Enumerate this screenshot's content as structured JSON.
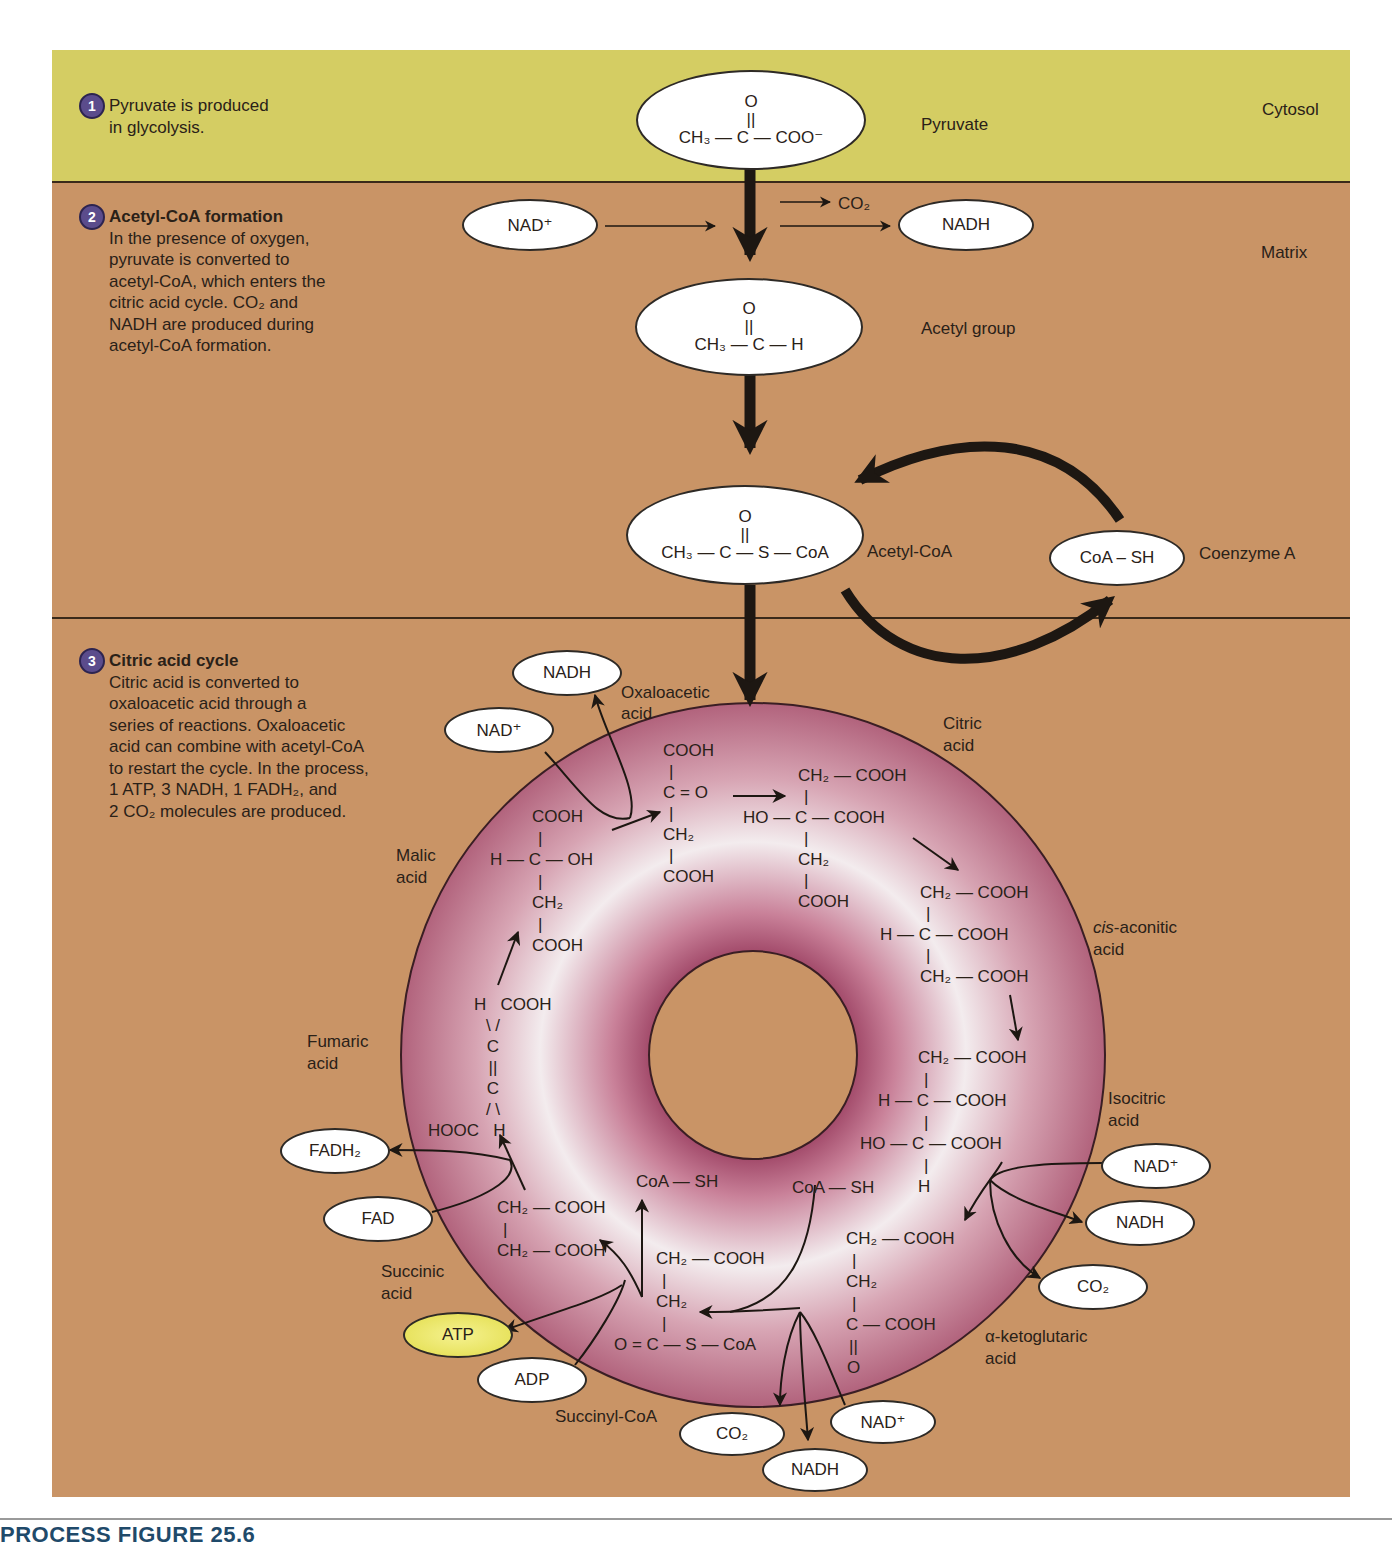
{
  "regions": {
    "cytosol": "Cytosol",
    "matrix": "Matrix"
  },
  "colors": {
    "cytosol_bg": "#d4cd63",
    "matrix_bg": "#c99466",
    "cycle_ring": "#b8687e",
    "step_badge": "#5b4c8c",
    "atp_fill": "#e2dc4a"
  },
  "steps": [
    {
      "number": "1",
      "title": "",
      "text": "Pyruvate is produced in glycolysis."
    },
    {
      "number": "2",
      "title": "Acetyl-CoA formation",
      "text": "In the presence of oxygen, pyruvate is converted to acetyl-CoA, which enters the citric acid cycle. CO2 and NADH are produced during acetyl-CoA formation."
    },
    {
      "number": "3",
      "title": "Citric acid cycle",
      "text": "Citric acid is converted to oxaloacetic acid through a series of reactions. Oxaloacetic acid can combine with acetyl-CoA to restart the cycle. In the process, 1 ATP, 3 NADH, 1 FADH2, and 2 CO2 molecules are produced."
    }
  ],
  "step_lines": {
    "s1": [
      "Pyruvate is produced",
      "in glycolysis."
    ],
    "s2": [
      "In the presence of oxygen,",
      "pyruvate is converted to",
      "acetyl-CoA, which enters the",
      "citric acid cycle. CO₂ and",
      "NADH are produced during",
      "acetyl-CoA formation."
    ],
    "s3": [
      "Citric acid is converted to",
      "oxaloacetic acid through a",
      "series of reactions. Oxaloacetic",
      "acid can combine with acetyl-CoA",
      "to restart the cycle. In the process,",
      "1 ATP, 3 NADH, 1 FADH₂, and",
      "2 CO₂ molecules are produced."
    ]
  },
  "molecule_labels": {
    "pyruvate": "Pyruvate",
    "acetyl_group": "Acetyl group",
    "acetyl_coa": "Acetyl-CoA",
    "coenzyme_a": "Coenzyme A",
    "oxaloacetic": [
      "Oxaloacetic",
      "acid"
    ],
    "citric": [
      "Citric",
      "acid"
    ],
    "cis_aconitic": [
      "cis",
      "-aconitic",
      "acid"
    ],
    "isocitric": [
      "Isocitric",
      "acid"
    ],
    "alpha_ketoglutaric": [
      "α-ketoglutaric",
      "acid"
    ],
    "succinyl_coa": "Succinyl-CoA",
    "succinic": [
      "Succinic",
      "acid"
    ],
    "fumaric": [
      "Fumaric",
      "acid"
    ],
    "malic": [
      "Malic",
      "acid"
    ]
  },
  "structures": {
    "pyruvate": {
      "top": "O",
      "bond": "||",
      "main": "CH₃ — C — COO⁻"
    },
    "acetyl_group": {
      "top": "O",
      "bond": "||",
      "main": "CH₃ — C — H"
    },
    "acetyl_coa": {
      "top": "O",
      "bond": "||",
      "main": "CH₃ — C — S — CoA"
    },
    "coa_sh": "CoA – SH",
    "oxaloacetic": [
      "COOH",
      "|",
      "C = O",
      "|",
      "CH₂",
      "|",
      "COOH"
    ],
    "citric": [
      "CH₂ — COOH",
      "|",
      "HO — C — COOH",
      "|",
      "CH₂",
      "|",
      "COOH"
    ],
    "cis_aconitic": [
      "CH₂ — COOH",
      "|",
      "H — C — COOH",
      "|",
      "CH₂ — COOH"
    ],
    "isocitric": [
      "CH₂ — COOH",
      "|",
      "H — C — COOH",
      "|",
      "HO — C — COOH",
      "|",
      "H"
    ],
    "alpha_ketoglutaric": [
      "CH₂ — COOH",
      "|",
      "CH₂",
      "|",
      "C — COOH",
      "||",
      "O"
    ],
    "succinyl_coa": [
      "CH₂ — COOH",
      "|",
      "CH₂",
      "|",
      "O = C — S — CoA"
    ],
    "succinic": [
      "CH₂ — COOH",
      "|",
      "CH₂ — COOH"
    ],
    "fumaric": [
      "H   COOH",
      "\\ /",
      "C",
      "||",
      "C",
      "/ \\",
      "HOOC   H"
    ],
    "malic": [
      "COOH",
      "|",
      "H — C — OH",
      "|",
      "CH₂",
      "|",
      "COOH"
    ],
    "coa_sh_1": "CoA — SH",
    "coa_sh_2": "CoA — SH"
  },
  "cofactors": {
    "nad_top": "NAD⁺",
    "nadh_top": "NADH",
    "co2_top": "CO₂",
    "nadh_oxalo": "NADH",
    "nad_oxalo": "NAD⁺",
    "nad_iso": "NAD⁺",
    "nadh_iso": "NADH",
    "co2_iso": "CO₂",
    "fadh2": "FADH₂",
    "fad": "FAD",
    "atp": "ATP",
    "adp": "ADP",
    "co2_kg": "CO₂",
    "nadh_kg": "NADH",
    "nad_kg": "NAD⁺"
  },
  "footer": {
    "caption": "PROCESS FIGURE 25.6"
  }
}
